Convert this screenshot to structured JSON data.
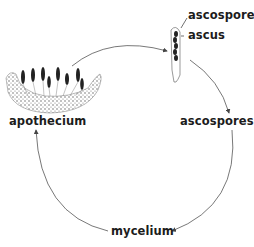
{
  "diagram": {
    "type": "life-cycle",
    "labels": {
      "ascospore": "ascospore",
      "ascus": "ascus",
      "ascospores": "ascospores",
      "mycelium": "mycelium",
      "apothecium": "apothecium"
    },
    "cycle_order": [
      "apothecium",
      "ascus",
      "ascospores",
      "mycelium",
      "apothecium"
    ],
    "colors": {
      "line": "#555555",
      "ink": "#1c1c1c",
      "stipple": "#6a6a6a"
    }
  }
}
